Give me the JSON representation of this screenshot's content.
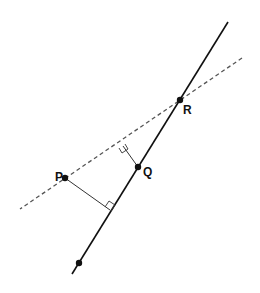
{
  "diagram": {
    "type": "geometry-projection",
    "colors": {
      "line": "#111111",
      "dashed": "#555555",
      "background": "#ffffff"
    },
    "solid_line": {
      "x1": 228,
      "y1": 22,
      "x2": 72,
      "y2": 274
    },
    "dashed_line": {
      "x1": 242,
      "y1": 58,
      "x2": 20,
      "y2": 209
    },
    "points": [
      {
        "id": "R",
        "label": "R",
        "x": 180,
        "y": 100,
        "lx": 183,
        "ly": 114
      },
      {
        "id": "Q",
        "label": "Q",
        "x": 138,
        "y": 167,
        "lx": 143,
        "ly": 176
      },
      {
        "id": "P",
        "label": "P",
        "x": 65,
        "y": 178,
        "lx": 55,
        "ly": 181
      },
      {
        "id": "unlabeled",
        "label": "",
        "x": 79,
        "y": 263
      }
    ],
    "perpendiculars": [
      {
        "from": "P",
        "to_line": "solid",
        "x1": 65,
        "y1": 178,
        "x2": 110,
        "y2": 210
      },
      {
        "from": "Q",
        "to_line": "dashed",
        "x1": 138,
        "y1": 167,
        "x2": 123,
        "y2": 146
      }
    ]
  }
}
